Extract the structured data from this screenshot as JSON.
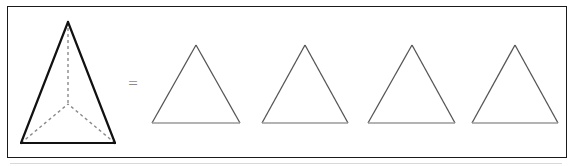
{
  "figure": {
    "caption": "",
    "relation_symbol": "=",
    "background_color": "#ffffff",
    "frame": {
      "border_color": "#1a1a1a",
      "border_width": 1,
      "x": 7,
      "y": 6,
      "width": 560,
      "height": 152
    },
    "bottom_rule": {
      "color": "#d9d9d9",
      "x": 10,
      "y": 163,
      "width": 552
    }
  },
  "shapes": {
    "tetrahedron": {
      "name": "tetrahedron",
      "edge_color": "#111111",
      "edge_width": 2.2,
      "hidden_edge_color": "#8a8a8a",
      "hidden_edge_width": 1.4,
      "hidden_edge_dash": "3,3",
      "apex": {
        "x": 68,
        "y": 22
      },
      "base_left": {
        "x": 21,
        "y": 143
      },
      "base_right": {
        "x": 115,
        "y": 143
      },
      "interior_vertex": {
        "x": 68,
        "y": 104
      },
      "visible_edges": [
        {
          "from": "apex",
          "to": "base_left"
        },
        {
          "from": "apex",
          "to": "base_right"
        },
        {
          "from": "base_left",
          "to": "base_right"
        }
      ],
      "hidden_edges": [
        {
          "from": "apex",
          "to": "interior_vertex"
        },
        {
          "from": "base_left",
          "to": "interior_vertex"
        },
        {
          "from": "base_right",
          "to": "interior_vertex"
        }
      ]
    },
    "triangles": [
      {
        "name": "triangle-1",
        "apex": {
          "x": 196,
          "y": 45
        },
        "base_left": {
          "x": 152,
          "y": 123
        },
        "base_right": {
          "x": 240,
          "y": 123
        },
        "stroke_color": "#555555",
        "base_color": "#9a9a9a",
        "stroke_width": 1.3,
        "fill": "none"
      },
      {
        "name": "triangle-2",
        "apex": {
          "x": 305,
          "y": 45
        },
        "base_left": {
          "x": 262,
          "y": 123
        },
        "base_right": {
          "x": 348,
          "y": 123
        },
        "stroke_color": "#555555",
        "base_color": "#9a9a9a",
        "stroke_width": 1.3,
        "fill": "none"
      },
      {
        "name": "triangle-3",
        "apex": {
          "x": 412,
          "y": 45
        },
        "base_left": {
          "x": 368,
          "y": 123
        },
        "base_right": {
          "x": 455,
          "y": 123
        },
        "stroke_color": "#555555",
        "base_color": "#9a9a9a",
        "stroke_width": 1.3,
        "fill": "none"
      },
      {
        "name": "triangle-4",
        "apex": {
          "x": 515,
          "y": 45
        },
        "base_left": {
          "x": 472,
          "y": 123
        },
        "base_right": {
          "x": 558,
          "y": 123
        },
        "stroke_color": "#555555",
        "base_color": "#9a9a9a",
        "stroke_width": 1.3,
        "fill": "none"
      }
    ]
  },
  "equals": {
    "symbol": "=",
    "color": "#8c8c8c",
    "x": 131,
    "y": 85
  }
}
